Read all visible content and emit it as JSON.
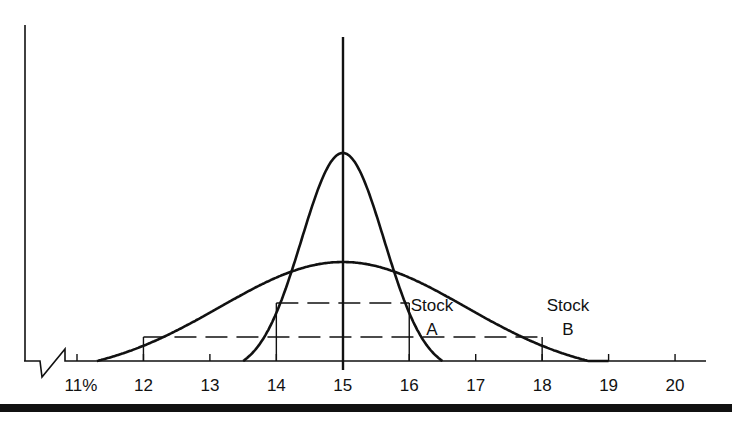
{
  "chart_data": {
    "type": "line",
    "title": "",
    "xlabel": "",
    "ylabel": "",
    "x_unit": "%",
    "x_ticks": [
      "11%",
      "12",
      "13",
      "14",
      "15",
      "16",
      "17",
      "18",
      "19",
      "20"
    ],
    "x_tick_values": [
      11,
      12,
      13,
      14,
      15,
      16,
      17,
      18,
      19,
      20
    ],
    "xlim": [
      10.2,
      20.5
    ],
    "axis_break": true,
    "grid": false,
    "legend": "inline labels",
    "mean_line": {
      "x": 15
    },
    "series": [
      {
        "name": "Stock A",
        "label_line1": "Stock",
        "label_line2": "A",
        "distribution": "normal",
        "mean": 15,
        "std_dev": 1,
        "range": [
          13.5,
          16.5
        ],
        "relative_peak_height": 1.0,
        "one_sigma_band": [
          14,
          16
        ]
      },
      {
        "name": "Stock B",
        "label_line1": "Stock",
        "label_line2": "B",
        "distribution": "normal",
        "mean": 15,
        "std_dev": 3,
        "range": [
          11.3,
          19
        ],
        "relative_peak_height": 0.48,
        "one_sigma_band": [
          12,
          18
        ]
      }
    ],
    "reference_lines": [
      {
        "type": "dashed",
        "from_x": 14,
        "to_x": 16,
        "series": "Stock A"
      },
      {
        "type": "dashed",
        "from_x": 12,
        "to_x": 18,
        "series": "Stock B"
      }
    ]
  },
  "colors": {
    "ink": "#111111",
    "background": "#ffffff"
  }
}
